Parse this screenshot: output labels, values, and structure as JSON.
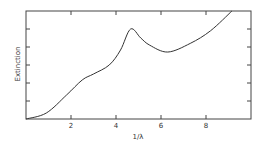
{
  "chart_data": {
    "type": "line",
    "title": "",
    "xlabel": "1/λ",
    "ylabel": "Extinction",
    "xlim": [
      0,
      10
    ],
    "ylim": [
      0,
      6
    ],
    "xticks": [
      2,
      4,
      6,
      8
    ],
    "xtick_labels": [
      "2",
      "4",
      "6",
      "8"
    ],
    "yticks": [
      1,
      2,
      3,
      4,
      5
    ],
    "ytick_labels": [
      "",
      "",
      "",
      "",
      ""
    ],
    "grid": false,
    "legend": null,
    "series": [
      {
        "name": "Extinction curve",
        "x": [
          0,
          0.9,
          1.8,
          2.5,
          3.0,
          3.7,
          4.2,
          4.65,
          5.1,
          5.5,
          6.3,
          7.3,
          8.2,
          9.15
        ],
        "y": [
          0,
          0.33,
          1.33,
          2.17,
          2.5,
          3.0,
          3.83,
          5.0,
          4.5,
          4.1,
          3.72,
          4.2,
          4.9,
          6.0
        ]
      }
    ],
    "annotations": []
  }
}
